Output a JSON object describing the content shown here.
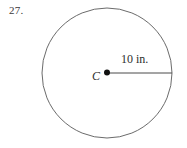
{
  "problem": {
    "number": "27."
  },
  "figure": {
    "type": "circle-with-radius",
    "circle": {
      "center_x": 107,
      "center_y": 73,
      "radius_px": 65,
      "stroke_color": "#6b6b6b",
      "stroke_width": 1,
      "fill": "none"
    },
    "center_point": {
      "label": "C",
      "dot_color": "#111111",
      "dot_radius_px": 3
    },
    "radius_segment": {
      "label": "10 in.",
      "from_x": 107,
      "from_y": 73,
      "to_x": 172,
      "to_y": 73,
      "stroke_color": "#4a4a4a",
      "stroke_width": 1
    }
  },
  "colors": {
    "background": "#ffffff",
    "ink": "#2e2e2e",
    "outline": "#6b6b6b"
  }
}
